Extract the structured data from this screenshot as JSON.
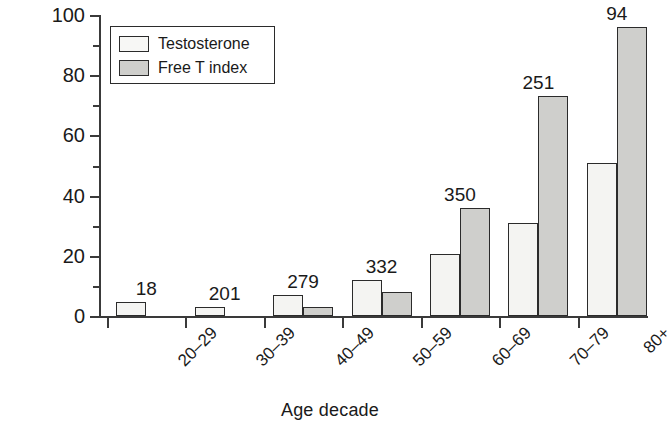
{
  "chart_data": {
    "type": "bar",
    "title": "",
    "xlabel": "Age decade",
    "ylabel": "Percentage",
    "ylim": [
      0,
      100
    ],
    "yticks": [
      0,
      20,
      40,
      60,
      80,
      100
    ],
    "yminorticks": [
      10,
      30,
      50,
      70,
      90
    ],
    "grid": false,
    "legend_position": "top-left",
    "categories": [
      "20–29",
      "30–39",
      "40–49",
      "50–59",
      "60–69",
      "70–79",
      "80+"
    ],
    "group_labels": [
      "18",
      "201",
      "279",
      "332",
      "350",
      "251",
      "94"
    ],
    "series": [
      {
        "name": "Testosterone",
        "color": "#f4f4f2",
        "values": [
          4.5,
          3,
          7,
          12,
          20.5,
          31,
          51
        ]
      },
      {
        "name": "Free T index",
        "color": "#cfcfcc",
        "values": [
          0,
          0,
          3,
          8,
          36,
          73,
          96
        ]
      }
    ]
  },
  "legend": {
    "items": [
      {
        "label": "Testosterone",
        "swatch": "testosterone"
      },
      {
        "label": "Free T index",
        "swatch": "freet"
      }
    ]
  }
}
